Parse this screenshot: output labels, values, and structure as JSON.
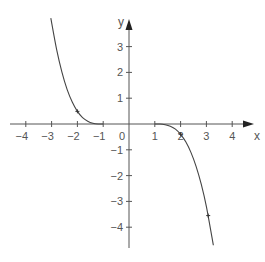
{
  "chart_data": {
    "type": "line",
    "title": "",
    "xlabel": "x",
    "ylabel": "y",
    "xlim": [
      -4.5,
      4.6
    ],
    "ylim": [
      -4.6,
      4.1
    ],
    "grid": false,
    "x_ticks": [
      -4,
      -3,
      -2,
      -1,
      1,
      2,
      3,
      4
    ],
    "x_tick_labels": [
      "−4",
      "−3",
      "−2",
      "−1",
      "1",
      "2",
      "3",
      "4"
    ],
    "y_ticks": [
      -4,
      -3,
      -2,
      -1,
      1,
      2,
      3
    ],
    "y_tick_labels": [
      "−4",
      "−3",
      "−2",
      "−1",
      "1",
      "2",
      "3"
    ],
    "origin_label": "0",
    "series": [
      {
        "name": "left branch",
        "x": [
          -3.03,
          -2.8,
          -2.6,
          -2.4,
          -2.2,
          -2.0,
          -1.8,
          -1.6,
          -1.4,
          -1.2,
          -1.0
        ],
        "y": [
          4.1,
          2.86,
          2.01,
          1.34,
          0.85,
          0.49,
          0.25,
          0.11,
          0.03,
          0.0,
          0.0
        ],
        "markers": [
          {
            "x": -2,
            "y": 0.49
          }
        ]
      },
      {
        "name": "right branch",
        "x": [
          1.0,
          1.2,
          1.4,
          1.6,
          1.8,
          2.0,
          2.2,
          2.4,
          2.6,
          2.8,
          3.0,
          3.27
        ],
        "y": [
          0.0,
          0.0,
          -0.03,
          -0.09,
          -0.2,
          -0.4,
          -0.69,
          -1.1,
          -1.64,
          -2.33,
          -3.2,
          -4.7
        ],
        "markers": [
          {
            "x": 2,
            "y": -0.4
          },
          {
            "x": 3.07,
            "y": -3.55
          }
        ]
      }
    ]
  },
  "axes": {
    "x_label": "x",
    "y_label": "y",
    "origin_label": "0"
  }
}
